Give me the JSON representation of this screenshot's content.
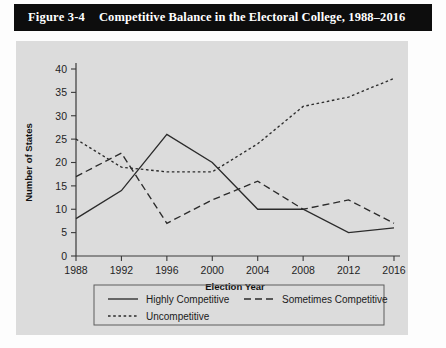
{
  "figure": {
    "number": "Figure 3-4",
    "title": "Competitive Balance in the Electoral College, 1988–2016"
  },
  "colors": {
    "title_band": "#0d0d0d",
    "title_text": "#ffffff",
    "panel_background": "#dcdcdc",
    "line": "#2b2b2b",
    "axis": "#3a3a3a"
  },
  "chart_data": {
    "type": "line",
    "title": "Competitive Balance in the Electoral College, 1988–2016",
    "xlabel": "Election Year",
    "ylabel": "Number of States",
    "categories": [
      "1988",
      "1992",
      "1996",
      "2000",
      "2004",
      "2008",
      "2012",
      "2016"
    ],
    "x": [
      1988,
      1992,
      1996,
      2000,
      2004,
      2008,
      2012,
      2016
    ],
    "xlim": [
      1988,
      2016
    ],
    "ylim": [
      0,
      40
    ],
    "yticks": [
      0,
      5,
      10,
      15,
      20,
      25,
      30,
      35,
      40
    ],
    "ytick_labels": [
      "0",
      "5",
      "10",
      "15",
      "20",
      "25",
      "30",
      "35",
      "40"
    ],
    "xticks": [
      1988,
      1992,
      1996,
      2000,
      2004,
      2008,
      2012,
      2016
    ],
    "xtick_labels": [
      "1988",
      "1992",
      "1996",
      "2000",
      "2004",
      "2008",
      "2012",
      "2016"
    ],
    "grid": false,
    "legend_position": "below-axes",
    "series": [
      {
        "name": "Highly Competitive",
        "style": "solid",
        "values": [
          8,
          14,
          26,
          20,
          10,
          10,
          5,
          6
        ]
      },
      {
        "name": "Sometimes Competitive",
        "style": "dashed",
        "values": [
          17,
          22,
          7,
          12,
          16,
          10,
          12,
          7
        ]
      },
      {
        "name": "Uncompetitive",
        "style": "dotted",
        "values": [
          25,
          19,
          18,
          18,
          24,
          32,
          34,
          38
        ]
      }
    ]
  }
}
